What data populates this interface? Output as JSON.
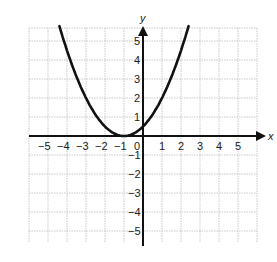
{
  "chart_data": {
    "type": "line",
    "title": "",
    "xlabel": "x",
    "ylabel": "y",
    "xlim": [
      -6,
      6
    ],
    "ylim": [
      -6,
      6
    ],
    "grid": true,
    "x_ticks": [
      "-5",
      "-4",
      "-3",
      "-2",
      "-1",
      "0",
      "1",
      "2",
      "3",
      "4",
      "5"
    ],
    "y_ticks": [
      "5",
      "4",
      "3",
      "2",
      "1",
      "-1",
      "-2",
      "-3",
      "-4",
      "-5"
    ],
    "series": [
      {
        "name": "parabola",
        "equation": "y = 0.5(x + 1)^2",
        "vertex": [
          -1,
          0
        ],
        "x": [
          -4.4,
          -4,
          -3.5,
          -3,
          -2.5,
          -2,
          -1.5,
          -1,
          -0.5,
          0,
          0.5,
          1,
          1.5,
          2,
          2.4
        ],
        "values": [
          5.78,
          4.5,
          3.13,
          2.0,
          1.13,
          0.5,
          0.13,
          0,
          0.13,
          0.5,
          1.13,
          2.0,
          3.13,
          4.5,
          5.78
        ]
      }
    ]
  },
  "labels": {
    "x_axis": "x",
    "y_axis": "y",
    "origin": "0"
  },
  "colors": {
    "curve": "#111111",
    "axis": "#111111",
    "grid": "#bbbbbb"
  }
}
